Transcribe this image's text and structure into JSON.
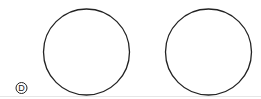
{
  "diagram": {
    "label": "D",
    "shapes": [
      {
        "type": "circle",
        "name": "left-circle",
        "cx": 86.5,
        "cy": 52,
        "r": 43
      },
      {
        "type": "circle",
        "name": "right-circle",
        "cx": 208.5,
        "cy": 52,
        "r": 43
      }
    ],
    "colors": {
      "stroke": "#222222",
      "baseline": "#e6e6e6",
      "background": "#ffffff"
    }
  }
}
